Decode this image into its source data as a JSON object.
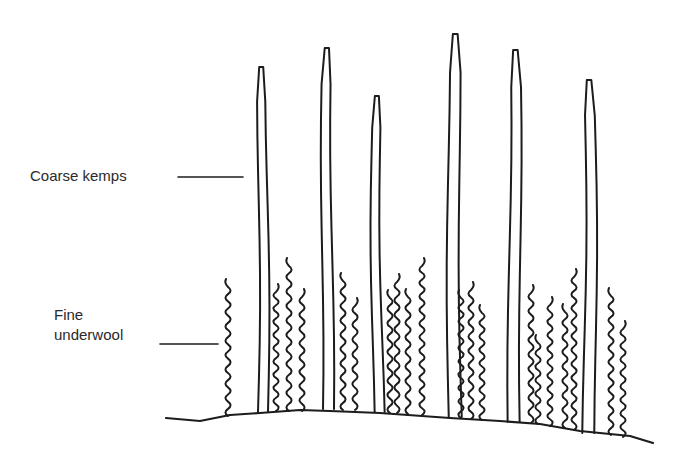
{
  "diagram": {
    "title": "",
    "colors": {
      "ink": "#1c1c1c",
      "text": "#2a2a2a",
      "background": "#ffffff"
    },
    "labels": [
      {
        "id": "coarse-kemps",
        "lines": [
          "Coarse kemps"
        ],
        "x": 30,
        "y": 167,
        "leader": {
          "x1": 178,
          "y1": 177,
          "x2": 243,
          "y2": 177
        }
      },
      {
        "id": "fine-underwool",
        "lines": [
          "Fine",
          "underwool"
        ],
        "x": 54,
        "y": 306,
        "leader": {
          "x1": 160,
          "y1": 344,
          "x2": 218,
          "y2": 344
        }
      }
    ],
    "skin_line": [
      [
        166,
        418
      ],
      [
        200,
        421
      ],
      [
        230,
        415
      ],
      [
        260,
        413
      ],
      [
        300,
        410
      ],
      [
        330,
        411
      ],
      [
        380,
        413
      ],
      [
        450,
        418
      ],
      [
        500,
        421
      ],
      [
        540,
        424
      ],
      [
        580,
        431
      ],
      [
        610,
        434
      ],
      [
        630,
        436
      ],
      [
        653,
        443
      ]
    ],
    "kemps": [
      {
        "x": 263,
        "top": 67,
        "base": 412,
        "width": 8
      },
      {
        "x": 327,
        "top": 48,
        "base": 409,
        "width": 9
      },
      {
        "x": 378,
        "top": 96,
        "base": 412,
        "width": 8
      },
      {
        "x": 455,
        "top": 34,
        "base": 417,
        "width": 11
      },
      {
        "x": 515,
        "top": 50,
        "base": 422,
        "width": 10
      },
      {
        "x": 590,
        "top": 80,
        "base": 433,
        "width": 10
      }
    ],
    "underwool": [
      {
        "x": 228,
        "top": 287,
        "base": 416
      },
      {
        "x": 276,
        "top": 292,
        "base": 411
      },
      {
        "x": 289,
        "top": 266,
        "base": 411
      },
      {
        "x": 302,
        "top": 297,
        "base": 411
      },
      {
        "x": 343,
        "top": 281,
        "base": 410
      },
      {
        "x": 355,
        "top": 306,
        "base": 410
      },
      {
        "x": 390,
        "top": 298,
        "base": 413
      },
      {
        "x": 397,
        "top": 282,
        "base": 413
      },
      {
        "x": 408,
        "top": 297,
        "base": 414
      },
      {
        "x": 422,
        "top": 266,
        "base": 415
      },
      {
        "x": 461,
        "top": 298,
        "base": 418
      },
      {
        "x": 471,
        "top": 290,
        "base": 419
      },
      {
        "x": 482,
        "top": 313,
        "base": 420
      },
      {
        "x": 531,
        "top": 293,
        "base": 423
      },
      {
        "x": 538,
        "top": 343,
        "base": 424
      },
      {
        "x": 550,
        "top": 305,
        "base": 426
      },
      {
        "x": 565,
        "top": 312,
        "base": 428
      },
      {
        "x": 574,
        "top": 277,
        "base": 430
      },
      {
        "x": 611,
        "top": 296,
        "base": 435
      },
      {
        "x": 623,
        "top": 329,
        "base": 437
      }
    ]
  }
}
